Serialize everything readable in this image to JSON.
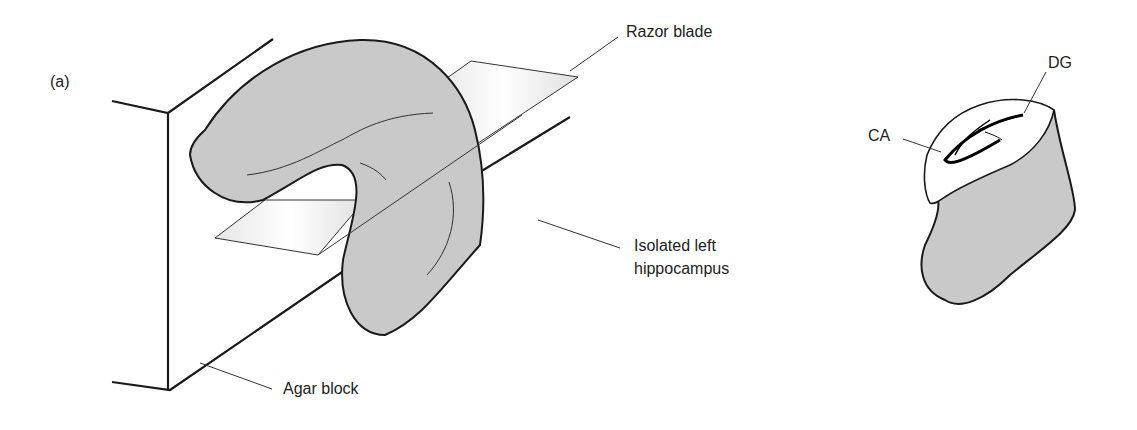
{
  "figure": {
    "panel_label": "(a)",
    "labels": {
      "razor_blade": "Razor blade",
      "isolated_line1": "Isolated left",
      "isolated_line2": "hippocampus",
      "agar_block": "Agar block",
      "dg": "DG",
      "ca": "CA"
    },
    "colors": {
      "tissue_fill": "#c9c9c9",
      "outline": "#1a1a1a",
      "background": "#ffffff"
    }
  }
}
